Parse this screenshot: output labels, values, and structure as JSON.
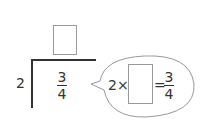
{
  "problem": {
    "divisor": "2",
    "dividend": {
      "numerator": "3",
      "denominator": "4"
    },
    "quotient_box": ""
  },
  "bubble": {
    "factor": "2",
    "times_sign": "×",
    "answer_box": "",
    "equals_sign": "=",
    "result": {
      "numerator": "3",
      "denominator": "4"
    }
  }
}
